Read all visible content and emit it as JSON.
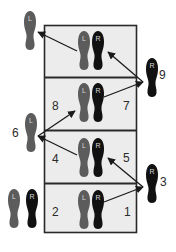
{
  "diagram": {
    "colors": {
      "box_fill": "#ececec",
      "box_border": "#2a2a2a",
      "left_foot": "#5c5c5c",
      "right_foot": "#111111",
      "foot_letter": "#d8d8d8",
      "arrow": "#1a1a1a"
    },
    "rows": [
      {
        "index": 1,
        "left_label": "",
        "right_label": ""
      },
      {
        "index": 2,
        "left_label": "8",
        "right_label": "7"
      },
      {
        "index": 3,
        "left_label": "4",
        "right_label": "5"
      },
      {
        "index": 4,
        "left_label": "2",
        "right_label": "1"
      }
    ],
    "outside_feet": [
      {
        "side": "L",
        "position": "top-left",
        "label": ""
      },
      {
        "side": "R",
        "position": "right-upper",
        "label": "9"
      },
      {
        "side": "L",
        "position": "left-middle",
        "label": "6"
      },
      {
        "side": "R",
        "position": "right-lower",
        "label": "3"
      }
    ],
    "start_pair": {
      "left": "L",
      "right": "R"
    },
    "foot_letters": {
      "left": "L",
      "right": "R"
    },
    "step_labels": {
      "s1": "1",
      "s2": "2",
      "s3": "3",
      "s4": "4",
      "s5": "5",
      "s6": "6",
      "s7": "7",
      "s8": "8",
      "s9": "9"
    }
  }
}
